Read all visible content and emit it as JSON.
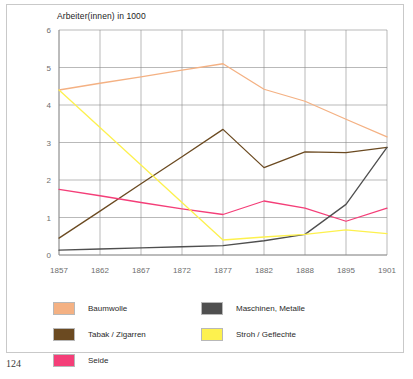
{
  "page": {
    "number": "124"
  },
  "chart_data": {
    "type": "line",
    "title": "Arbeiter(innen) in 1000",
    "xlabel": "",
    "ylabel": "",
    "ylim": [
      0,
      6
    ],
    "yticks": [
      0,
      1,
      2,
      3,
      4,
      5,
      6
    ],
    "ytick_labels": [
      "0",
      "1",
      "2",
      "3",
      "4",
      "5",
      "6"
    ],
    "grid": true,
    "legend_position": "bottom",
    "categories": [
      "1857",
      "1862",
      "1867",
      "1872",
      "1877",
      "1882",
      "1888",
      "1895",
      "1901"
    ],
    "x": [
      1857,
      1862,
      1867,
      1872,
      1877,
      1882,
      1888,
      1895,
      1901
    ],
    "series": [
      {
        "name": "Baumwolle",
        "color": "#f4b183",
        "values": [
          4.4,
          4.58,
          4.75,
          4.93,
          5.1,
          4.42,
          4.1,
          3.62,
          3.15
        ]
      },
      {
        "name": "Tabak / Zigarren",
        "color": "#6b4a21",
        "values": [
          0.45,
          1.17,
          1.9,
          2.62,
          3.35,
          2.33,
          2.75,
          2.73,
          2.87
        ]
      },
      {
        "name": "Seide",
        "color": "#f43e78",
        "values": [
          1.75,
          1.58,
          1.4,
          1.23,
          1.08,
          1.44,
          1.25,
          0.9,
          1.25
        ]
      },
      {
        "name": "Maschinen, Metalle",
        "color": "#4f4f4f",
        "values": [
          0.13,
          0.16,
          0.19,
          0.22,
          0.25,
          0.38,
          0.55,
          1.35,
          2.87
        ]
      },
      {
        "name": "Stroh / Geflechte",
        "color": "#fdf14e",
        "values": [
          4.4,
          3.4,
          2.4,
          1.4,
          0.4,
          0.48,
          0.55,
          0.67,
          0.57
        ]
      }
    ]
  },
  "legend": {
    "left_column": [
      {
        "label": "Baumwolle",
        "color": "#f4b183"
      },
      {
        "label": "Tabak / Zigarren",
        "color": "#6b4a21"
      },
      {
        "label": "Seide",
        "color": "#f43e78"
      }
    ],
    "right_column": [
      {
        "label": "Maschinen, Metalle",
        "color": "#4f4f4f"
      },
      {
        "label": "Stroh / Geflechte",
        "color": "#fdf14e"
      }
    ]
  }
}
